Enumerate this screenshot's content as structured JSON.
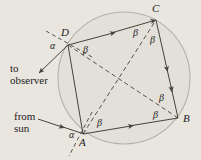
{
  "figure": {
    "name": "cyclic-quadrilateral-rainbow-geometry",
    "background_color": "#e9e6df",
    "ink_color": "#46423d",
    "circle": {
      "fill": "#e3e0d9",
      "stroke": "#b4b0a8",
      "cx": 124,
      "cy": 78,
      "r": 66
    },
    "captions": {
      "to_observer": "to\nobserver",
      "from_sun": "from\nsun"
    },
    "points": [
      {
        "label": "A",
        "x": 83,
        "y": 134,
        "label_x": 82,
        "label_y": 144
      },
      {
        "label": "B",
        "x": 178,
        "y": 118,
        "label_x": 183,
        "label_y": 121
      },
      {
        "label": "C",
        "x": 156,
        "y": 20,
        "label_x": 155,
        "label_y": 11
      },
      {
        "label": "D",
        "x": 68,
        "y": 45,
        "label_x": 64,
        "label_y": 35
      }
    ],
    "angles": [
      {
        "label": "α",
        "at": "A",
        "x": 73,
        "y": 138
      },
      {
        "label": "α",
        "at": "D",
        "x": 54,
        "y": 48
      },
      {
        "label": "β",
        "at": "A",
        "x": 100,
        "y": 125
      },
      {
        "label": "β",
        "at": "B",
        "x": 156,
        "y": 116
      },
      {
        "label": "β",
        "at": "B",
        "x": 162,
        "y": 99
      },
      {
        "label": "β",
        "at": "C",
        "x": 136,
        "y": 36
      },
      {
        "label": "β",
        "at": "C",
        "x": 153,
        "y": 42
      },
      {
        "label": "β",
        "at": "D",
        "x": 86,
        "y": 53
      }
    ],
    "chords": [
      {
        "name": "chord-D-C",
        "from": "D",
        "to": "C",
        "style": "solid",
        "arrow": "mid"
      },
      {
        "name": "chord-C-B",
        "from": "C",
        "to": "B",
        "style": "solid",
        "arrow": "mid"
      },
      {
        "name": "chord-A-B",
        "from": "A",
        "to": "B",
        "style": "solid",
        "arrow": "mid"
      },
      {
        "name": "chord-D-A",
        "from": "D",
        "to": "A",
        "style": "solid",
        "arrow": "none"
      }
    ],
    "diagonals": [
      {
        "name": "diagonal-A-C",
        "from": "A",
        "to": "C",
        "style": "dashed"
      },
      {
        "name": "diagonal-D-B",
        "from": "D",
        "to": "B",
        "style": "dashed"
      }
    ],
    "rays": [
      {
        "name": "ray-from-sun",
        "label": "from sun",
        "style": "solid",
        "arrow": "toward-A"
      },
      {
        "name": "ray-to-observer",
        "label": "to observer",
        "style": "solid",
        "arrow": "away-from-D"
      }
    ],
    "normals": [
      {
        "name": "normal-at-A",
        "style": "dashed"
      },
      {
        "name": "normal-at-D",
        "style": "dashed"
      }
    ]
  }
}
